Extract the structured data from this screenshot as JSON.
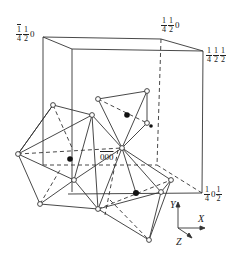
{
  "diagram": {
    "type": "crystal-structure-polyhedra",
    "corner_labels": [
      {
        "id": "back-top-left",
        "bar": "1",
        "num": "1",
        "den": "4",
        "num2": "1",
        "den2": "2",
        "tail": "0"
      },
      {
        "id": "back-top-right",
        "num": "1",
        "den": "4",
        "num2": "1",
        "den2": "2",
        "tail": "0"
      },
      {
        "id": "front-top-right",
        "num": "1",
        "den": "4",
        "num2": "1",
        "den2": "2",
        "num3": "1",
        "den3": "2"
      },
      {
        "id": "front-bottom-right",
        "num": "1",
        "den": "4",
        "mid": "0",
        "num2": "1",
        "den2": "2"
      }
    ],
    "origin_label": "000",
    "origin_bar": "0",
    "axes": {
      "x": "X",
      "y": "Y",
      "z": "Z"
    },
    "caption": "...."
  }
}
